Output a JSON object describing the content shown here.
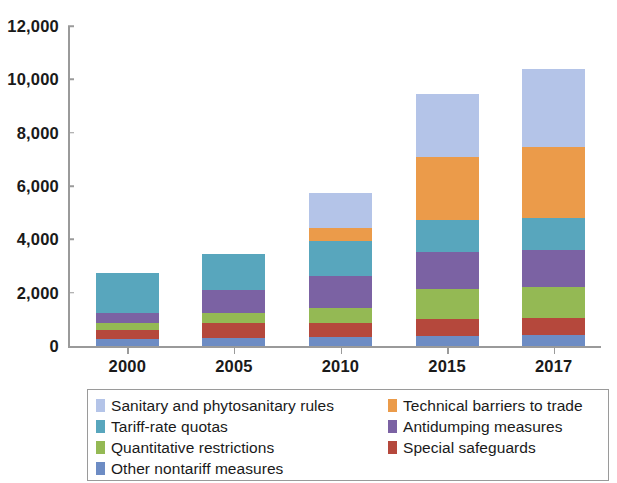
{
  "chart_data": {
    "type": "bar",
    "stacked": true,
    "title": "",
    "subtitle": "",
    "xlabel": "",
    "ylabel": "",
    "categories": [
      "2000",
      "2005",
      "2010",
      "2015",
      "2017"
    ],
    "ylim": [
      0,
      12000
    ],
    "ytick_values": [
      0,
      2000,
      4000,
      6000,
      8000,
      10000,
      12000
    ],
    "ytick_labels": [
      "0",
      "2,000",
      "4,000",
      "6,000",
      "8,000",
      "10,000",
      "12,000"
    ],
    "grid": false,
    "legend_position": "bottom",
    "legend_columns": 2,
    "series": [
      {
        "name": "Other nontariff measures",
        "color": "#6d8cc4",
        "values": [
          280,
          300,
          330,
          380,
          400
        ]
      },
      {
        "name": "Special safeguards",
        "color": "#b5483c",
        "values": [
          330,
          560,
          540,
          640,
          640
        ]
      },
      {
        "name": "Quantitative restrictions",
        "color": "#94b954",
        "values": [
          260,
          370,
          560,
          1130,
          1180
        ]
      },
      {
        "name": "Antidumping measures",
        "color": "#7b62a3",
        "values": [
          380,
          870,
          1200,
          1390,
          1390
        ]
      },
      {
        "name": "Tariff-rate quotas",
        "color": "#58a6bd",
        "values": [
          1500,
          1340,
          1320,
          1180,
          1180
        ]
      },
      {
        "name": "Technical barriers to trade",
        "color": "#eb9b4a",
        "values": [
          0,
          0,
          460,
          2370,
          2660
        ]
      },
      {
        "name": "Sanitary and phytosanitary rules",
        "color": "#b4c4e8",
        "values": [
          0,
          0,
          1340,
          2350,
          2930
        ]
      }
    ],
    "totals": [
      2750,
      3440,
      5750,
      9440,
      10380
    ]
  },
  "legend": {
    "entries": [
      {
        "label": "Sanitary and phytosanitary rules",
        "color": "#b4c4e8"
      },
      {
        "label": "Technical barriers to trade",
        "color": "#eb9b4a"
      },
      {
        "label": "Tariff-rate quotas",
        "color": "#58a6bd"
      },
      {
        "label": "Antidumping measures",
        "color": "#7b62a3"
      },
      {
        "label": "Quantitative restrictions",
        "color": "#94b954"
      },
      {
        "label": "Special safeguards",
        "color": "#b5483c"
      },
      {
        "label": "Other nontariff measures",
        "color": "#6d8cc4"
      }
    ]
  }
}
